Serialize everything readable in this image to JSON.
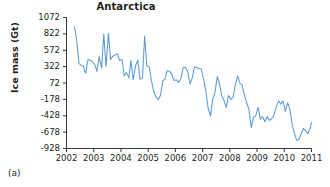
{
  "figure": {
    "panel_label": "(a)",
    "title": "Antarctica"
  },
  "chart_data": {
    "type": "line",
    "title": "Antarctica",
    "xlabel": "",
    "ylabel": "Ice mass (Gt)",
    "grid": false,
    "legend": "none",
    "line_color": "#5b9bd5",
    "axis_color": "#231f20",
    "xlim": [
      2002.0,
      2011.0
    ],
    "ylim": [
      -928,
      1072
    ],
    "xticks": [
      2002,
      2003,
      2004,
      2005,
      2006,
      2007,
      2008,
      2009,
      2010,
      2011
    ],
    "xtick_labels": [
      "2002",
      "2003",
      "2004",
      "2005",
      "2006",
      "2007",
      "2008",
      "2009",
      "2010",
      "2011"
    ],
    "yticks": [
      1072,
      822,
      572,
      322,
      72,
      -178,
      -428,
      -678,
      -928
    ],
    "ytick_labels": [
      "1072",
      "822",
      "572",
      "322",
      "72",
      "-178",
      "-428",
      "-678",
      "-928"
    ],
    "series": [
      {
        "name": "Antarctica ice mass anomaly",
        "x": [
          2002.3,
          2002.38,
          2002.46,
          2002.54,
          2002.62,
          2002.7,
          2002.79,
          2002.87,
          2002.95,
          2003.04,
          2003.12,
          2003.2,
          2003.29,
          2003.37,
          2003.45,
          2003.54,
          2003.62,
          2003.7,
          2003.79,
          2003.87,
          2003.95,
          2004.04,
          2004.12,
          2004.2,
          2004.29,
          2004.37,
          2004.45,
          2004.54,
          2004.62,
          2004.7,
          2004.79,
          2004.87,
          2004.95,
          2005.04,
          2005.12,
          2005.2,
          2005.29,
          2005.37,
          2005.45,
          2005.54,
          2005.62,
          2005.7,
          2005.79,
          2005.87,
          2005.95,
          2006.04,
          2006.12,
          2006.2,
          2006.29,
          2006.37,
          2006.45,
          2006.54,
          2006.62,
          2006.7,
          2006.79,
          2006.87,
          2006.95,
          2007.04,
          2007.12,
          2007.2,
          2007.29,
          2007.37,
          2007.45,
          2007.54,
          2007.62,
          2007.7,
          2007.79,
          2007.87,
          2007.95,
          2008.04,
          2008.12,
          2008.2,
          2008.29,
          2008.37,
          2008.45,
          2008.54,
          2008.62,
          2008.7,
          2008.79,
          2008.87,
          2008.95,
          2009.04,
          2009.12,
          2009.2,
          2009.29,
          2009.37,
          2009.45,
          2009.54,
          2009.62,
          2009.7,
          2009.79,
          2009.87,
          2009.95,
          2010.04,
          2010.12,
          2010.2,
          2010.29,
          2010.37,
          2010.45,
          2010.54,
          2010.62,
          2010.7,
          2010.79,
          2010.87,
          2010.95,
          2011.0
        ],
        "y": [
          930,
          700,
          370,
          340,
          330,
          220,
          430,
          420,
          400,
          350,
          250,
          480,
          300,
          820,
          320,
          830,
          430,
          480,
          500,
          520,
          420,
          430,
          180,
          230,
          150,
          420,
          120,
          340,
          420,
          130,
          150,
          790,
          330,
          320,
          110,
          -50,
          -140,
          -180,
          -120,
          110,
          130,
          260,
          250,
          200,
          110,
          120,
          80,
          140,
          310,
          310,
          250,
          60,
          150,
          320,
          310,
          290,
          290,
          120,
          -50,
          -310,
          -430,
          -180,
          -80,
          170,
          60,
          -120,
          -200,
          -300,
          -120,
          -180,
          -140,
          40,
          180,
          70,
          40,
          -120,
          -230,
          -330,
          -610,
          -450,
          -430,
          -300,
          -480,
          -440,
          -520,
          -440,
          -500,
          -470,
          -420,
          -300,
          -200,
          -250,
          -200,
          -360,
          -230,
          -320,
          -560,
          -690,
          -800,
          -790,
          -700,
          -620,
          -660,
          -700,
          -620,
          -530
        ]
      }
    ]
  }
}
